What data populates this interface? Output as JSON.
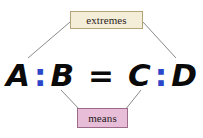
{
  "diagram": {
    "background_color": "#ffffff",
    "equation": {
      "first_term": "A",
      "ratio_colon_left": ":",
      "second_term": "B",
      "equals_sign": "=",
      "third_term": "C",
      "ratio_colon_right": ":",
      "fourth_term": "D",
      "term_color": "#0a0a0a",
      "colon_color": "#2b46c8"
    },
    "labels": {
      "extremes": {
        "text": "extremes",
        "fill_color": "#f4eed8",
        "border_color": "#b3a577",
        "text_color": "#2a2118"
      },
      "means": {
        "text": "means",
        "fill_color": "#e7bdd8",
        "border_color": "#9c6a8b",
        "text_color": "#241a20"
      }
    },
    "connectors": {
      "line_color": "#8a8a8a",
      "extremes_to_a": "line from extremes box left edge down-left to term A",
      "extremes_to_d": "line from extremes box right edge down-right to term D",
      "means_to_b": "line from term B down-right to means box left top",
      "means_to_c": "line from term C down-left to means box right top"
    }
  }
}
